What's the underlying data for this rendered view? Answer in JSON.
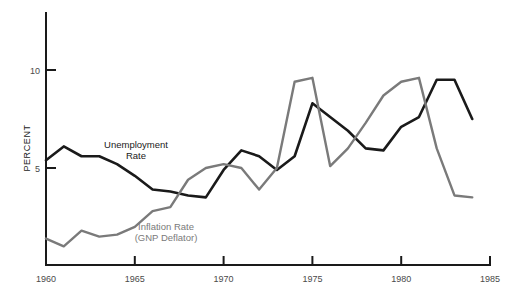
{
  "chart_data": {
    "type": "line",
    "title": "",
    "xlabel": "",
    "ylabel": "PERCENT",
    "xlim": [
      1960,
      1985
    ],
    "ylim": [
      0,
      12.8
    ],
    "grid": false,
    "legend": "inline-annotations",
    "y_ticks": [
      5,
      10
    ],
    "y_tick_labels": [
      "5",
      "10"
    ],
    "x_ticks": [
      1960,
      1965,
      1970,
      1975,
      1980,
      1985
    ],
    "x_tick_labels": [
      "1960",
      "1965",
      "1970",
      "1975",
      "1980",
      "1985"
    ],
    "x": [
      1960,
      1961,
      1962,
      1963,
      1964,
      1965,
      1966,
      1967,
      1968,
      1969,
      1970,
      1971,
      1972,
      1973,
      1974,
      1975,
      1976,
      1977,
      1978,
      1979,
      1980,
      1981,
      1982,
      1983,
      1984
    ],
    "series": [
      {
        "name": "Unemployment Rate",
        "color": "#1a1a1a",
        "width": 2.6,
        "values": [
          5.4,
          6.1,
          5.6,
          5.6,
          5.2,
          4.6,
          3.9,
          3.8,
          3.6,
          3.5,
          4.9,
          5.9,
          5.6,
          4.9,
          5.6,
          8.3,
          7.6,
          6.9,
          6.0,
          5.9,
          7.1,
          7.6,
          9.5,
          9.5,
          7.5
        ]
      },
      {
        "name": "Inflation Rate (GNP Deflator)",
        "color": "#7a7a7a",
        "width": 2.4,
        "values": [
          1.4,
          1.0,
          1.8,
          1.5,
          1.6,
          2.0,
          2.8,
          3.0,
          4.4,
          5.0,
          5.2,
          5.0,
          3.9,
          5.0,
          9.4,
          9.6,
          5.1,
          6.0,
          7.3,
          8.7,
          9.4,
          9.6,
          6.0,
          3.6,
          3.5
        ]
      }
    ],
    "annotations": [
      {
        "name": "unemployment-label",
        "lines": [
          "Unemployment",
          "Rate"
        ],
        "x": 136,
        "y": 148,
        "color": "#1a1a1a"
      },
      {
        "name": "inflation-label",
        "lines": [
          "Inflation Rate",
          "(GNP Deflator)"
        ],
        "x": 166,
        "y": 230,
        "color": "#7a7a7a"
      }
    ]
  },
  "axes": {
    "y_axis_title": "PERCENT"
  }
}
